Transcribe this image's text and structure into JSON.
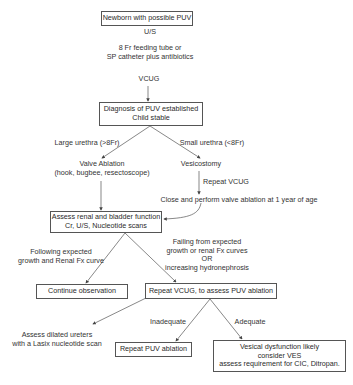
{
  "nodes": {
    "newborn": "Newborn with possible PUV",
    "diagnosis": [
      "Diagnosis of PUV established",
      "Child stable"
    ],
    "assess_function": [
      "Assess renal and bladder function",
      "Cr, U/S, Nucleotide scans"
    ],
    "continue": "Continue observation",
    "repeat_vcug": "Repeat VCUG, to assess PUV ablation",
    "repeat_ablation": "Repeat PUV ablation",
    "vesical": [
      "Vesical dysfunction likely",
      "consider VES",
      "assess requirement for CIC, Ditropan."
    ]
  },
  "labels": {
    "us": "U/S",
    "feeding": [
      "8 Fr feeding tube or",
      "SP catheter plus antibiotics"
    ],
    "vcug": "VCUG",
    "large_urethra": "Large urethra (>8Fr)",
    "small_urethra": "Small urethra (<8Fr)",
    "valve_ablation": [
      "Valve Ablation",
      "(hook, bugbee, resectoscope)"
    ],
    "vesicostomy": "Vesicostomy",
    "repeat_vcug_edge": "Repeat VCUG",
    "close_perform": "Close and perform  valve ablation at 1 year of age",
    "following": [
      "Following expected",
      "growth and Renal Fx curve"
    ],
    "failing": [
      "Failing from expected",
      "growth or renal Fx curves",
      "OR",
      "increasing hydronephrosis"
    ],
    "assess_ureters": [
      "Assess dilated ureters",
      "with a Lasix nucleotide scan"
    ],
    "inadequate": "Inadequate",
    "adequate": "Adequate"
  }
}
